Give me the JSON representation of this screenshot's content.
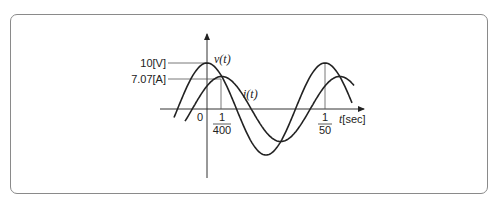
{
  "diagram": {
    "type": "waveform",
    "labels": {
      "v_peak": "10[V]",
      "i_peak": "7.07[A]",
      "v_curve": "v(t)",
      "i_curve": "i(t)",
      "origin": "0",
      "tick1_num": "1",
      "tick1_den": "400",
      "tick2_num": "1",
      "tick2_den": "50",
      "x_axis_var": "t",
      "x_axis_unit": "[sec]"
    },
    "colors": {
      "stroke": "#222222",
      "frame": "#8a8a8a",
      "guide": "#555555"
    }
  },
  "chart_data": {
    "type": "line",
    "title": "",
    "xlabel": "t[sec]",
    "ylabel": "",
    "x_ticks": [
      "0",
      "1/400",
      "1/50"
    ],
    "y_ticks": [
      "10[V]",
      "7.07[A]"
    ],
    "series": [
      {
        "name": "v(t)",
        "amplitude": 10,
        "unit": "V",
        "period": 0.02,
        "peak_at": 0
      },
      {
        "name": "i(t)",
        "amplitude": 7.07,
        "unit": "A",
        "period": 0.02,
        "peak_at": 0.0025
      }
    ]
  }
}
